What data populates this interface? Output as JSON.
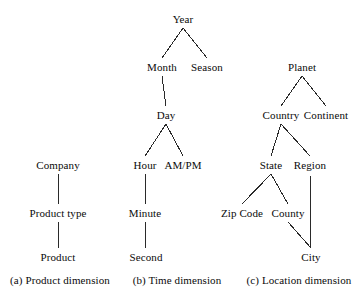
{
  "figure": {
    "background_color": "#ffffff",
    "text_color": "#0a0a0a",
    "edge_color": "#2a2a2a"
  },
  "chart_data": {
    "type": "diagram",
    "diagram_kind": "concept-hierarchy-trees",
    "title": "",
    "panels": [
      {
        "id": "product",
        "caption": "(a) Product dimension",
        "caption_x": 60,
        "caption_y": 275,
        "nodes": [
          {
            "id": "company",
            "label": "Company",
            "x": 58,
            "y": 160
          },
          {
            "id": "product_type",
            "label": "Product type",
            "x": 58,
            "y": 208
          },
          {
            "id": "product",
            "label": "Product",
            "x": 58,
            "y": 252
          }
        ],
        "edges": [
          {
            "from": "company",
            "to": "product_type"
          },
          {
            "from": "product_type",
            "to": "product"
          }
        ]
      },
      {
        "id": "time",
        "caption": "(b) Time dimension",
        "caption_x": 177,
        "caption_y": 275,
        "nodes": [
          {
            "id": "year",
            "label": "Year",
            "x": 183,
            "y": 14
          },
          {
            "id": "month",
            "label": "Month",
            "x": 162,
            "y": 62
          },
          {
            "id": "season",
            "label": "Season",
            "x": 207,
            "y": 62
          },
          {
            "id": "day",
            "label": "Day",
            "x": 166,
            "y": 110
          },
          {
            "id": "hour",
            "label": "Hour",
            "x": 145,
            "y": 160
          },
          {
            "id": "ampm",
            "label": "AM/PM",
            "x": 183,
            "y": 160
          },
          {
            "id": "minute",
            "label": "Minute",
            "x": 145,
            "y": 208
          },
          {
            "id": "second",
            "label": "Second",
            "x": 146,
            "y": 252
          }
        ],
        "edges": [
          {
            "from": "year",
            "to": "month"
          },
          {
            "from": "year",
            "to": "season"
          },
          {
            "from": "month",
            "to": "day"
          },
          {
            "from": "day",
            "to": "hour"
          },
          {
            "from": "day",
            "to": "ampm"
          },
          {
            "from": "hour",
            "to": "minute"
          },
          {
            "from": "minute",
            "to": "second"
          }
        ]
      },
      {
        "id": "location",
        "caption": "(c) Location dimension",
        "caption_x": 299,
        "caption_y": 275,
        "nodes": [
          {
            "id": "planet",
            "label": "Planet",
            "x": 302,
            "y": 62
          },
          {
            "id": "country",
            "label": "Country",
            "x": 281,
            "y": 110
          },
          {
            "id": "continent",
            "label": "Continent",
            "x": 326,
            "y": 110
          },
          {
            "id": "state",
            "label": "State",
            "x": 271,
            "y": 160
          },
          {
            "id": "region",
            "label": "Region",
            "x": 310,
            "y": 160
          },
          {
            "id": "zipcode",
            "label": "Zip Code",
            "x": 242,
            "y": 208
          },
          {
            "id": "county",
            "label": "County",
            "x": 288,
            "y": 208
          },
          {
            "id": "city",
            "label": "City",
            "x": 311,
            "y": 252
          }
        ],
        "edges": [
          {
            "from": "planet",
            "to": "country"
          },
          {
            "from": "planet",
            "to": "continent"
          },
          {
            "from": "country",
            "to": "state"
          },
          {
            "from": "country",
            "to": "region"
          },
          {
            "from": "state",
            "to": "zipcode"
          },
          {
            "from": "state",
            "to": "county"
          },
          {
            "from": "county",
            "to": "city"
          },
          {
            "from": "region",
            "to": "city"
          }
        ]
      }
    ]
  }
}
